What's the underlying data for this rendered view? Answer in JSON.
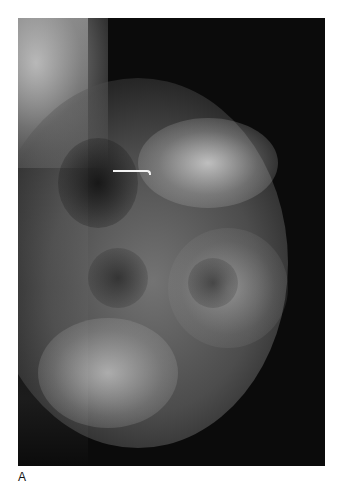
{
  "figure": {
    "panel_label": "A",
    "image_description": "Mammogram (grayscale X-ray of breast tissue) with a thin white localization wire marker",
    "colors": {
      "background": "#ffffff",
      "image_background": "#0b0b0b",
      "marker": "#f2f2f2"
    }
  }
}
